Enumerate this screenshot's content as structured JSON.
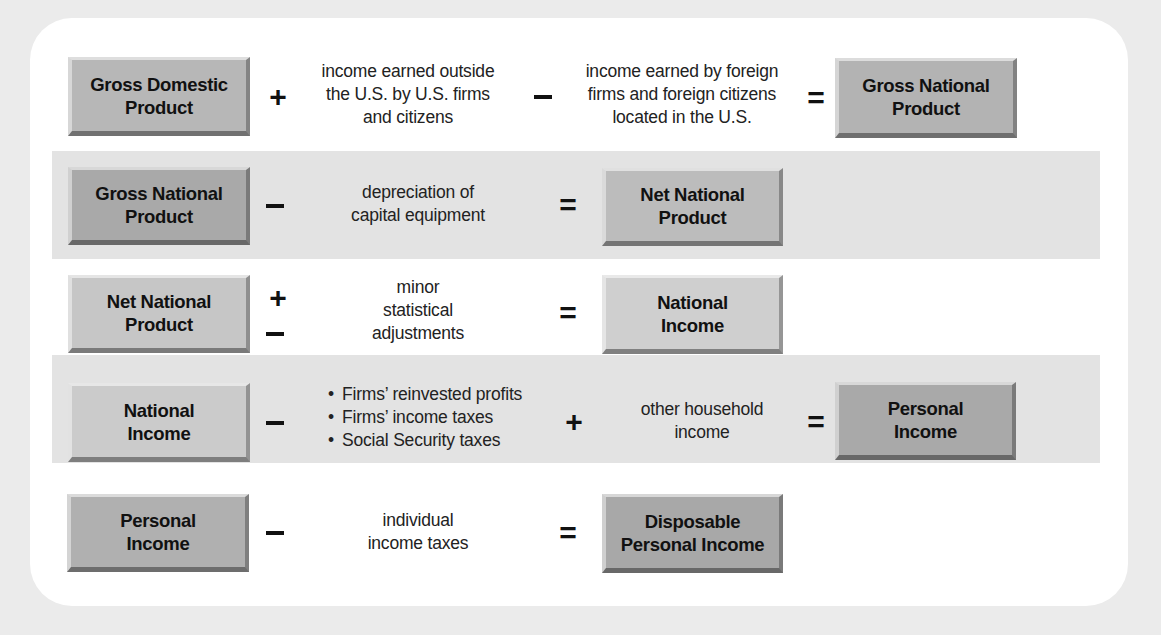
{
  "diagram": {
    "rows": [
      {
        "id": "gnp-from-gdp",
        "start": {
          "label": "Gross Domestic\nProduct",
          "color": "#b7b7b7"
        },
        "terms": [
          {
            "op": "+",
            "text": "income earned outside\nthe U.S. by U.S. firms\nand citizens"
          },
          {
            "op": "−",
            "text": "income earned by foreign\nfirms and foreign citizens\nlocated in the U.S."
          }
        ],
        "equals": "=",
        "result": {
          "label": "Gross National\nProduct",
          "color": "#b3b3b3"
        },
        "shaded": false
      },
      {
        "id": "nnp-from-gnp",
        "start": {
          "label": "Gross National\nProduct",
          "color": "#a9a9a9"
        },
        "terms": [
          {
            "op": "−",
            "text": "depreciation of\ncapital equipment"
          }
        ],
        "equals": "=",
        "result": {
          "label": "Net National\nProduct",
          "color": "#bcbcbc"
        },
        "shaded": true
      },
      {
        "id": "ni-from-nnp",
        "start": {
          "label": "Net National\nProduct",
          "color": "#c6c6c6"
        },
        "terms": [
          {
            "op": "±",
            "op_top": "+",
            "op_bottom": "−",
            "text": "minor\nstatistical\nadjustments"
          }
        ],
        "equals": "=",
        "result": {
          "label": "National\nIncome",
          "color": "#cfcfcf"
        },
        "shaded": false
      },
      {
        "id": "pi-from-ni",
        "start": {
          "label": "National\nIncome",
          "color": "#cbcbcb"
        },
        "terms": [
          {
            "op": "−",
            "bullets": [
              "Firms’ reinvested profits",
              "Firms’ income taxes",
              "Social Security taxes"
            ]
          },
          {
            "op": "+",
            "text": "other household\nincome"
          }
        ],
        "equals": "=",
        "result": {
          "label": "Personal\nIncome",
          "color": "#a9a9a9"
        },
        "shaded": true
      },
      {
        "id": "dpi-from-pi",
        "start": {
          "label": "Personal\nIncome",
          "color": "#b0b0b0"
        },
        "terms": [
          {
            "op": "−",
            "text": "individual\nincome taxes"
          }
        ],
        "equals": "=",
        "result": {
          "label": "Disposable\nPersonal Income",
          "color": "#a8a8a8"
        },
        "shaded": false
      }
    ]
  },
  "colors": {
    "page_background": "#ebebeb",
    "card_background": "#ffffff",
    "band_shade": "#e3e3e3",
    "text": "#1a1a1a"
  }
}
